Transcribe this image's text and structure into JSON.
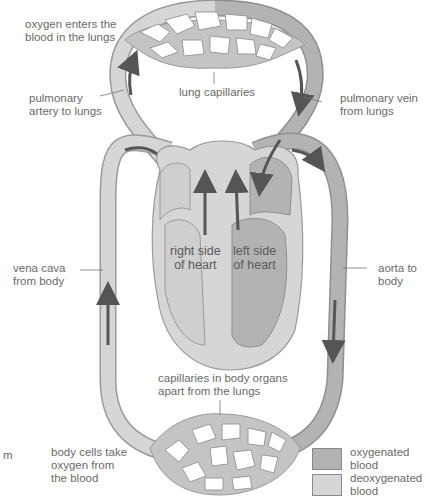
{
  "labels": {
    "oxygen_enters": "oxygen enters the\nblood in the lungs",
    "pulmonary_artery": "pulmonary\nartery to lungs",
    "lung_capillaries": "lung capillaries",
    "pulmonary_vein": "pulmonary vein\nfrom lungs",
    "right_side": "right side\nof heart",
    "left_side": "left side\nof heart",
    "vena_cava": "vena cava\nfrom body",
    "aorta": "aorta to\nbody",
    "body_capillaries": "capillaries in body organs\napart from the lungs",
    "body_cells": "body cells take\noxygen from\nthe blood",
    "cut_fragment": "m"
  },
  "legend": [
    {
      "label": "oxygenated\nblood",
      "color": "#b3b3b3"
    },
    {
      "label": "deoxygenated\nblood",
      "color": "#d6d6d6"
    }
  ],
  "colors": {
    "oxygenated": "#b3b3b3",
    "deoxygenated": "#d6d6d6",
    "outline": "#8f8f8f",
    "arrow": "#5a5a5a",
    "text": "#6a6a6a"
  }
}
